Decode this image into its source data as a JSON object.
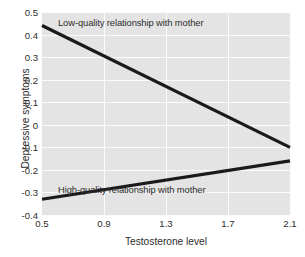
{
  "chart_data": {
    "type": "line",
    "title": "",
    "xlabel": "Testosterone level",
    "ylabel": "Depressive symptoms",
    "xlim": [
      0.5,
      2.1
    ],
    "ylim": [
      -0.4,
      0.5
    ],
    "xticks": [
      "0.5",
      "0.9",
      "1.3",
      "1.7",
      "2.1"
    ],
    "xtick_values": [
      0.5,
      0.9,
      1.3,
      1.7,
      2.1
    ],
    "yticks": [
      "0.5",
      "0.4",
      "0.3",
      "0.2",
      "0.1",
      "0",
      "-0.1",
      "-0.2",
      "-0.3",
      "-0.4"
    ],
    "ytick_values": [
      0.5,
      0.4,
      0.3,
      0.2,
      0.1,
      0,
      -0.1,
      -0.2,
      -0.3,
      -0.4
    ],
    "grid": true,
    "grid_color": "#fbfbfb",
    "panel_background": "#e4e4e4",
    "line_color": "#1a1a1a",
    "legend_position": "inline-annotations",
    "x": [
      0.5,
      2.1
    ],
    "series": [
      {
        "name": "Low-quality relationship with mother",
        "values": [
          0.44,
          -0.1
        ],
        "annotation": "Low-quality relationship with mother"
      },
      {
        "name": "High-quality relationship with mother",
        "values": [
          -0.33,
          -0.16
        ],
        "annotation": "High-quality relationship with mother"
      }
    ],
    "annotations": [
      "Low-quality relationship with mother",
      "High-quality relationship with mother"
    ]
  }
}
